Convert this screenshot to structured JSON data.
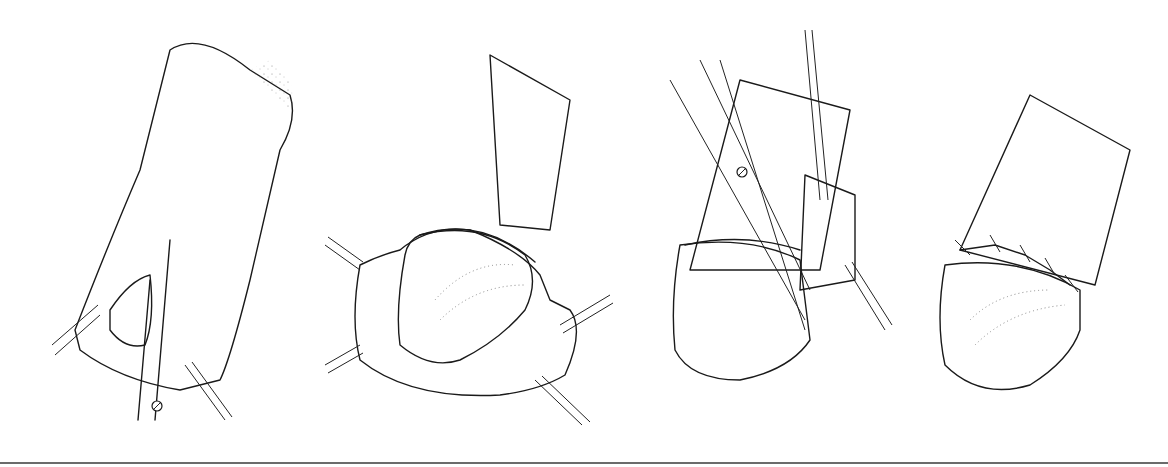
{
  "figure": {
    "type": "surgical-illustration",
    "style": "stippled line drawing",
    "background": "#ffffff",
    "ink_color": "#1a1a1a",
    "rule_color": "#6b6b6b",
    "panels": [
      {
        "index": 1,
        "depiction": "scissors-incision-with-forceps"
      },
      {
        "index": 2,
        "depiction": "retracted-tissue-with-four-clamps"
      },
      {
        "index": 3,
        "depiction": "scissors-trimming-with-forceps"
      },
      {
        "index": 4,
        "depiction": "sutured-ring-closure"
      }
    ]
  }
}
